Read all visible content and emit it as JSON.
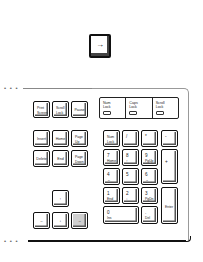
{
  "highlighted_key": {
    "label": "→",
    "icon": "arrow-right-icon"
  },
  "keyboard": {
    "system_keys": [
      {
        "line1": "Print",
        "line2": "Screen"
      },
      {
        "line1": "Scroll",
        "line2": "Lock"
      },
      {
        "line1": "Pause",
        "line2": ""
      }
    ],
    "lock_indicators": [
      {
        "line1": "Num",
        "line2": "Lock"
      },
      {
        "line1": "Caps",
        "line2": "Lock"
      },
      {
        "line1": "Scroll",
        "line2": "Lock"
      }
    ],
    "nav_keys": [
      {
        "line1": "Insert",
        "line2": ""
      },
      {
        "line1": "Home",
        "line2": ""
      },
      {
        "line1": "Page",
        "line2": "Up"
      },
      {
        "line1": "Delete",
        "line2": ""
      },
      {
        "line1": "End",
        "line2": ""
      },
      {
        "line1": "Page",
        "line2": "Down"
      }
    ],
    "arrow_keys": {
      "up": "↑",
      "left": "←",
      "down": "↓",
      "right": "→"
    },
    "numpad": {
      "num_lock": {
        "line1": "Num",
        "line2": "Lock"
      },
      "divide": "/",
      "multiply": "*",
      "minus": "-",
      "plus": "+",
      "enter": "Enter",
      "n7": {
        "top": "7",
        "bot": "Home"
      },
      "n8": {
        "top": "8",
        "bot": "↑"
      },
      "n9": {
        "top": "9",
        "bot": "PgUp"
      },
      "n4": {
        "top": "4",
        "bot": "←"
      },
      "n5": {
        "top": "5",
        "bot": ""
      },
      "n6": {
        "top": "6",
        "bot": "→"
      },
      "n1": {
        "top": "1",
        "bot": "End"
      },
      "n2": {
        "top": "2",
        "bot": "↓"
      },
      "n3": {
        "top": "3",
        "bot": "PgDn"
      },
      "n0": {
        "top": "0",
        "bot": "Ins"
      },
      "dot": {
        "top": ".",
        "bot": "Del"
      }
    },
    "dots": "• • •"
  }
}
